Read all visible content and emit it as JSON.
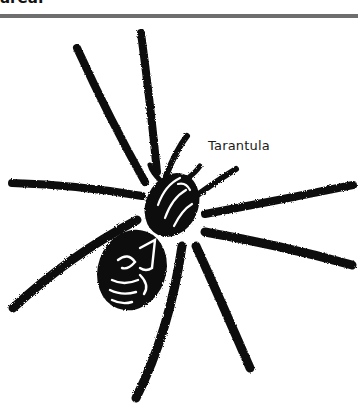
{
  "header": {
    "partial_text": "area:"
  },
  "figure": {
    "label": "Tarantula",
    "colors": {
      "ink": "#0d0d0d",
      "divider": "#6e6e6e",
      "background": "#ffffff"
    }
  }
}
